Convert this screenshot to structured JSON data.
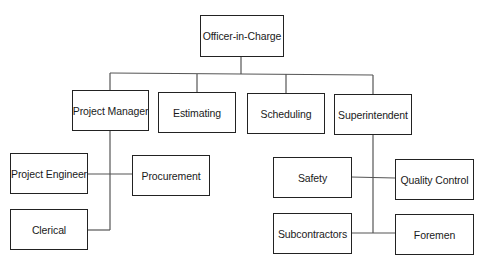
{
  "chart": {
    "root": "Officer-in-Charge",
    "level1": [
      "Project Manager",
      "Estimating",
      "Scheduling",
      "Superintendent"
    ],
    "project_manager_reports": [
      "Project Engineer",
      "Procurement",
      "Clerical"
    ],
    "superintendent_reports": [
      "Safety",
      "Quality Control",
      "Subcontractors",
      "Foremen"
    ]
  },
  "nodes": {
    "officer": "Officer-in-Charge",
    "project_manager": "Project Manager",
    "estimating": "Estimating",
    "scheduling": "Scheduling",
    "superintendent": "Superintendent",
    "project_engineer": "Project Engineer",
    "procurement": "Procurement",
    "clerical": "Clerical",
    "safety": "Safety",
    "quality_control": "Quality Control",
    "subcontractors": "Subcontractors",
    "foremen": "Foremen"
  },
  "colors": {
    "line": "#555555",
    "border": "#222222",
    "background": "#ffffff"
  }
}
